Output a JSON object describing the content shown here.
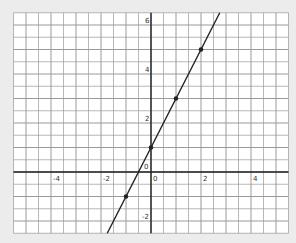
{
  "chart_data": {
    "type": "line",
    "title": "",
    "xlabel": "",
    "ylabel": "",
    "xlim": [
      -5.5,
      5.5
    ],
    "ylim": [
      -2.5,
      6.5
    ],
    "grid": true,
    "grid_step": 0.5,
    "x_ticks": [
      {
        "value": -4,
        "label": "-4"
      },
      {
        "value": -2,
        "label": "-2"
      },
      {
        "value": 0,
        "label": "0"
      },
      {
        "value": 2,
        "label": "2"
      },
      {
        "value": 4,
        "label": "4"
      }
    ],
    "y_ticks": [
      {
        "value": -2,
        "label": "-2"
      },
      {
        "value": 0,
        "label": "0"
      },
      {
        "value": 2,
        "label": "2"
      },
      {
        "value": 4,
        "label": "4"
      },
      {
        "value": 6,
        "label": "6"
      }
    ],
    "series": [
      {
        "name": "y = 2x + 1",
        "slope": 2,
        "intercept": 1,
        "points": [
          {
            "x": -1,
            "y": -1
          },
          {
            "x": 0,
            "y": 1
          },
          {
            "x": 1,
            "y": 3
          },
          {
            "x": 2,
            "y": 5
          }
        ],
        "color": "#222222"
      }
    ],
    "legend": null
  },
  "colors": {
    "background": "#ececec",
    "plot_area": "#ffffff",
    "grid_line": "#9a9a9a",
    "axis_line": "#222222",
    "series_line": "#222222"
  }
}
